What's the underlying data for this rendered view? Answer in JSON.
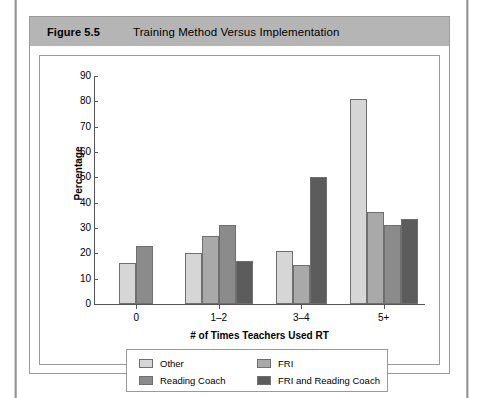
{
  "figure": {
    "number": "Figure 5.5",
    "title": "Training Method Versus Implementation"
  },
  "chart_data": {
    "type": "bar",
    "title": "Training Method Versus Implementation",
    "xlabel": "# of Times Teachers Used RT",
    "ylabel": "Percentage",
    "categories": [
      "0",
      "1–2",
      "3–4",
      "5+"
    ],
    "ylim": [
      0,
      90
    ],
    "yticks": [
      0,
      10,
      20,
      30,
      40,
      50,
      60,
      70,
      80,
      90
    ],
    "grid": false,
    "legend_position": "bottom",
    "series": [
      {
        "name": "Other",
        "color": "#d6d6d6",
        "values": [
          16,
          20,
          21,
          81
        ]
      },
      {
        "name": "FRI",
        "color": "#a9a9a9",
        "values": [
          null,
          27,
          15.5,
          36.5
        ]
      },
      {
        "name": "Reading Coach",
        "color": "#8b8b8b",
        "values": [
          23,
          31,
          null,
          31
        ]
      },
      {
        "name": "FRI and Reading Coach",
        "color": "#5c5c5c",
        "values": [
          null,
          17,
          50,
          33.5
        ]
      }
    ]
  },
  "legend": {
    "entries": [
      {
        "label": "Other",
        "color": "#d6d6d6"
      },
      {
        "label": "FRI",
        "color": "#a9a9a9"
      },
      {
        "label": "Reading Coach",
        "color": "#8b8b8b"
      },
      {
        "label": "FRI and Reading Coach",
        "color": "#5c5c5c"
      }
    ]
  }
}
